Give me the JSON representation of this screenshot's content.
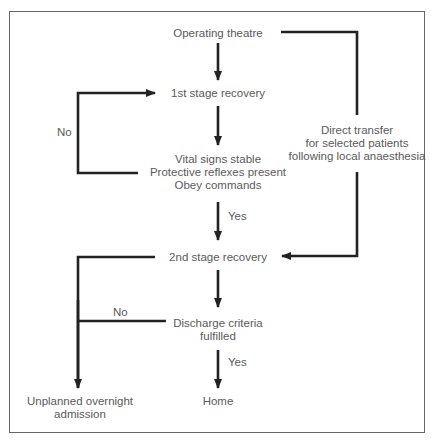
{
  "diagram": {
    "nodes": {
      "operating_theatre": "Operating theatre",
      "first_stage": "1st stage recovery",
      "criteria_1": "Vital signs stable",
      "criteria_2": "Protective reflexes present",
      "criteria_3": "Obey commands",
      "second_stage": "2nd stage recovery",
      "discharge_1": "Discharge criteria",
      "discharge_2": "fulfilled",
      "home": "Home",
      "admission_1": "Unplanned overnight",
      "admission_2": "admission",
      "direct_1": "Direct transfer",
      "direct_2": "for selected patients",
      "direct_3": "following local anaesthesia"
    },
    "edge_labels": {
      "no_loop": "No",
      "yes_to_second": "Yes",
      "no_admission": "No",
      "yes_home": "Yes"
    },
    "colors": {
      "line": "#222222",
      "text": "#5a5a5a",
      "frame": "#666666"
    }
  }
}
